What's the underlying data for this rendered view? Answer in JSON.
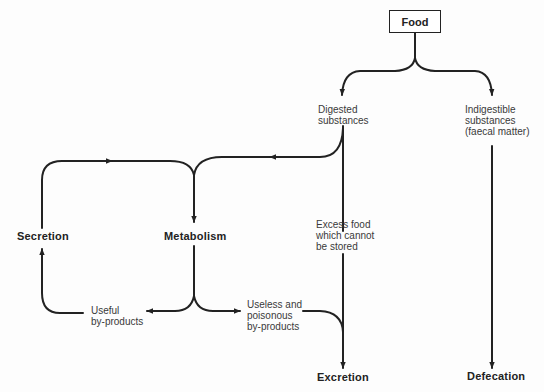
{
  "diagram": {
    "type": "flowchart",
    "nodes": {
      "food": "Food",
      "digested": "Digested\nsubstances",
      "indigestible": "Indigestible\nsubstances\n(faecal matter)",
      "excess": "Excess food\nwhich cannot\nbe stored",
      "metabolism": "Metabolism",
      "secretion": "Secretion",
      "useful": "Useful\nby-products",
      "useless": "Useless and\npoisonous\nby-products",
      "excretion": "Excretion",
      "defecation": "Defecation"
    },
    "edges": [
      {
        "from": "Food",
        "to": "Digested substances"
      },
      {
        "from": "Food",
        "to": "Indigestible substances (faecal matter)"
      },
      {
        "from": "Digested substances",
        "to": "Metabolism"
      },
      {
        "from": "Digested substances",
        "to": "Excretion",
        "label": "Excess food which cannot be stored"
      },
      {
        "from": "Indigestible substances (faecal matter)",
        "to": "Defecation"
      },
      {
        "from": "Metabolism",
        "to": "Useful by-products"
      },
      {
        "from": "Metabolism",
        "to": "Useless and poisonous by-products"
      },
      {
        "from": "Useful by-products",
        "to": "Secretion"
      },
      {
        "from": "Secretion",
        "to": "Metabolism"
      },
      {
        "from": "Useless and poisonous by-products",
        "to": "Excretion"
      }
    ],
    "colors": {
      "line": "#222222",
      "text": "#3a3a3a",
      "background": "#fdfdfd"
    }
  }
}
